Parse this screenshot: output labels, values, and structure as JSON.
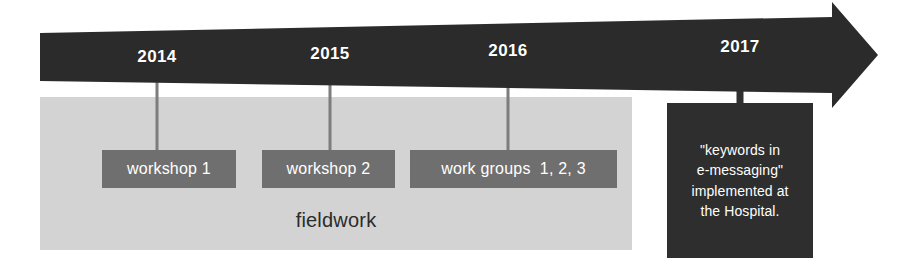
{
  "figure": {
    "name": "project-timeline",
    "type": "timeline-arrow-diagram"
  },
  "colors": {
    "arrow": "#2b2b2b",
    "band": "#d3d3d3",
    "chip": "#6f6f6f",
    "outcome_box": "#2e2e2e",
    "stem": "#7d7d7d",
    "stem_thick": "#303030",
    "text_light": "#ffffff",
    "text_dark": "#2b2b2b",
    "background": "#ffffff"
  },
  "axis": {
    "name": "time-arrow",
    "direction": "left-to-right",
    "years": [
      {
        "label": "2014",
        "x": 157
      },
      {
        "label": "2015",
        "x": 330
      },
      {
        "label": "2016",
        "x": 508
      },
      {
        "label": "2017",
        "x": 740
      }
    ]
  },
  "band": {
    "label": "fieldwork"
  },
  "events": [
    {
      "id": "workshop-1",
      "label": "workshop 1",
      "year": "2014",
      "left": 102,
      "width": 134,
      "stem_x": 157
    },
    {
      "id": "workshop-2",
      "label": "workshop 2",
      "year": "2015",
      "left": 262,
      "width": 133,
      "stem_x": 330
    },
    {
      "id": "work-groups",
      "label": "work groups  1, 2, 3",
      "year": "2016",
      "left": 410,
      "width": 207,
      "stem_x": 508
    }
  ],
  "outcome": {
    "year": "2017",
    "text": "\"keywords in\ne-messaging\"\nimplemented at\nthe Hospital.",
    "stem_x": 740
  }
}
